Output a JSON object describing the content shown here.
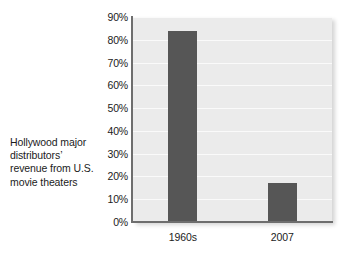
{
  "caption": {
    "lines": [
      "Hollywood major",
      "distributors’",
      "revenue from U.S.",
      "movie theaters"
    ]
  },
  "colors": {
    "bar": "#565656",
    "plot_background": "#ebebeb",
    "axis": "#6e6e6e",
    "text": "#1b1b1b",
    "gridline": "#ffffff",
    "page_background": "#ffffff"
  },
  "chart_data": {
    "type": "bar",
    "title": "",
    "subtitle": "",
    "xlabel": "",
    "ylabel": "",
    "categories": [
      "1960s",
      "2007"
    ],
    "values": [
      84,
      17
    ],
    "value_labels": [
      "84%",
      "17%"
    ],
    "ylim": [
      0,
      90
    ],
    "ytick_values": [
      0,
      10,
      20,
      30,
      40,
      50,
      60,
      70,
      80,
      90
    ],
    "ytick_labels": [
      "0%",
      "10%",
      "20%",
      "30%",
      "40%",
      "50%",
      "60%",
      "70%",
      "80%",
      "90%"
    ],
    "grid": true,
    "grid_axis": "y",
    "legend": false,
    "legend_position": "none",
    "annotations": [
      "Hollywood major distributors’ revenue from U.S. movie theaters"
    ]
  }
}
